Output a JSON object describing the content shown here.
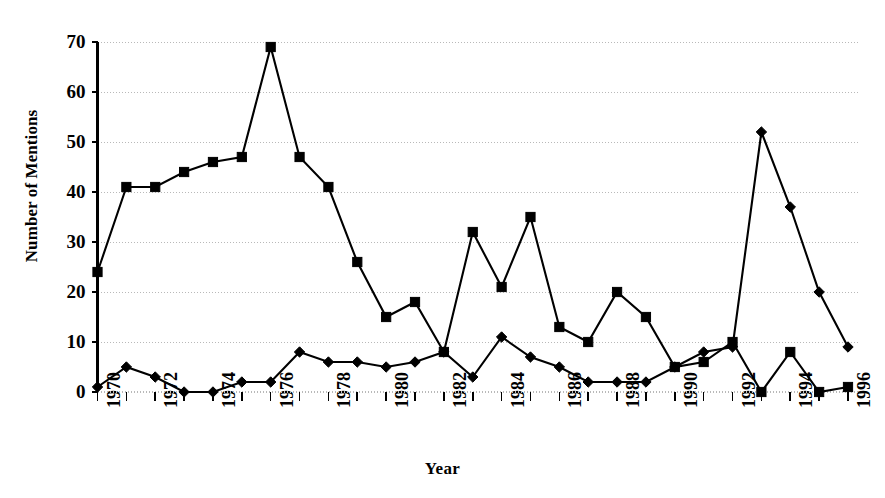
{
  "chart_data": {
    "type": "line",
    "title": "",
    "xlabel": "Year",
    "ylabel": "Number of Mentions",
    "grid": true,
    "legend": "none",
    "xlim": [
      1970,
      1996
    ],
    "ylim": [
      0,
      70
    ],
    "ytick_values": [
      0,
      10,
      20,
      30,
      40,
      50,
      60,
      70
    ],
    "ytick_labels": [
      "0",
      "10",
      "20",
      "30",
      "40",
      "50",
      "60",
      "70"
    ],
    "xtick_values": [
      1970,
      1971,
      1972,
      1973,
      1974,
      1975,
      1976,
      1977,
      1978,
      1979,
      1980,
      1981,
      1982,
      1983,
      1984,
      1985,
      1986,
      1987,
      1988,
      1989,
      1990,
      1991,
      1992,
      1993,
      1994,
      1995,
      1996
    ],
    "xtick_labels": [
      "1970",
      "",
      "1972",
      "",
      "1974",
      "",
      "1976",
      "",
      "1978",
      "",
      "1980",
      "",
      "1982",
      "",
      "1984",
      "",
      "1986",
      "",
      "1988",
      "",
      "1990",
      "",
      "1992",
      "",
      "1994",
      "",
      "1996"
    ],
    "x": [
      1970,
      1971,
      1972,
      1973,
      1974,
      1975,
      1976,
      1977,
      1978,
      1979,
      1980,
      1981,
      1982,
      1983,
      1984,
      1985,
      1986,
      1987,
      1988,
      1989,
      1990,
      1991,
      1992,
      1993,
      1994,
      1995,
      1996
    ],
    "series": [
      {
        "name": "square-series",
        "marker": "square",
        "color": "#000000",
        "values": [
          24,
          41,
          41,
          44,
          46,
          47,
          69,
          47,
          41,
          26,
          15,
          18,
          8,
          32,
          21,
          35,
          13,
          10,
          20,
          15,
          5,
          6,
          10,
          0,
          8,
          0,
          1
        ]
      },
      {
        "name": "diamond-series",
        "marker": "diamond",
        "color": "#000000",
        "values": [
          1,
          5,
          3,
          0,
          0,
          2,
          2,
          8,
          6,
          6,
          5,
          6,
          8,
          3,
          11,
          7,
          5,
          2,
          2,
          2,
          5,
          8,
          9,
          52,
          37,
          20,
          9
        ]
      }
    ]
  },
  "colors": {
    "ink": "#000000",
    "grid": "#b9b9b9",
    "background": "#ffffff"
  }
}
